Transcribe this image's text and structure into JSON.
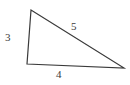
{
  "figure": {
    "kind": "triangle-diagram",
    "background_color": "#ffffff",
    "stroke_color": "#3a3a3a",
    "stroke_width": 1.2,
    "text_color": "#3b3b3b",
    "vertices": {
      "apex": {
        "x": 31,
        "y": 10
      },
      "bottom_left": {
        "x": 27,
        "y": 64
      },
      "bottom_right": {
        "x": 124,
        "y": 68
      }
    },
    "polygon_points": "31,10 27,64 124,68",
    "labels": {
      "left_side": "3",
      "bottom_side": "4",
      "hypotenuse": "5"
    }
  },
  "chart_data": {
    "type": "diagram",
    "title": "",
    "shape": "triangle",
    "side_lengths": [
      3,
      4,
      5
    ],
    "side_label_map": [
      {
        "side": "left",
        "label": "3",
        "from": "apex",
        "to": "bottom_left"
      },
      {
        "side": "bottom",
        "label": "4",
        "from": "bottom_left",
        "to": "bottom_right"
      },
      {
        "side": "hypotenuse",
        "label": "5",
        "from": "apex",
        "to": "bottom_right"
      }
    ]
  }
}
